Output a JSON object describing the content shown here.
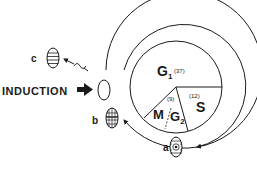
{
  "diagram": {
    "type": "cell-cycle",
    "induction_label": "INDUCTION",
    "phases": [
      {
        "id": "g1",
        "label": "G",
        "sub": "1",
        "duration": "(37)"
      },
      {
        "id": "s",
        "label": "S",
        "sub": "",
        "duration": "(12)"
      },
      {
        "id": "m_g2",
        "label": "M",
        "sub2_label": "G",
        "sub": "2",
        "duration": "(9)"
      }
    ],
    "cells": [
      {
        "id": "a",
        "label": "a"
      },
      {
        "id": "b",
        "label": "b"
      },
      {
        "id": "c",
        "label": "c"
      }
    ],
    "colors": {
      "stroke": "#1a1a1a",
      "background": "#ffffff"
    }
  }
}
